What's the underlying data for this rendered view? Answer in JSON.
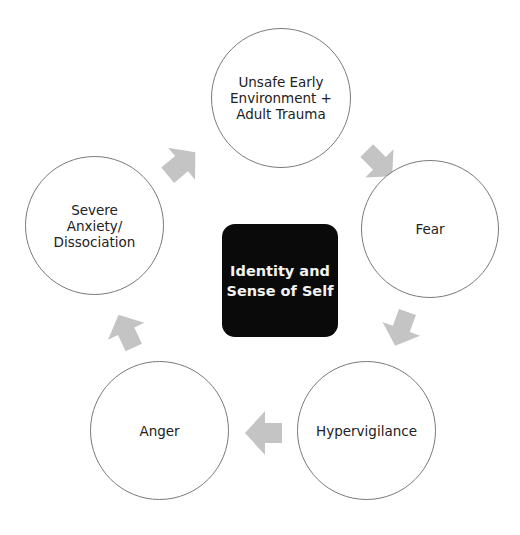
{
  "diagram": {
    "type": "cycle",
    "center": {
      "label": "Identity and\nSense of Self"
    },
    "nodes": [
      {
        "id": "unsafe",
        "label": "Unsafe Early\nEnvironment +\nAdult Trauma"
      },
      {
        "id": "fear",
        "label": "Fear"
      },
      {
        "id": "hypervigilance",
        "label": "Hypervigilance"
      },
      {
        "id": "anger",
        "label": "Anger"
      },
      {
        "id": "anxiety",
        "label": "Severe\nAnxiety/\nDissociation"
      }
    ],
    "edges": [
      {
        "from": "unsafe",
        "to": "fear"
      },
      {
        "from": "fear",
        "to": "hypervigilance"
      },
      {
        "from": "hypervigilance",
        "to": "anger"
      },
      {
        "from": "anger",
        "to": "anxiety"
      },
      {
        "from": "anxiety",
        "to": "unsafe"
      }
    ],
    "colors": {
      "arrow": "#c4c4c4",
      "center_fill": "#0a0a0a",
      "center_text": "#f2f2f2",
      "circle_stroke": "#7a7a7a"
    }
  }
}
